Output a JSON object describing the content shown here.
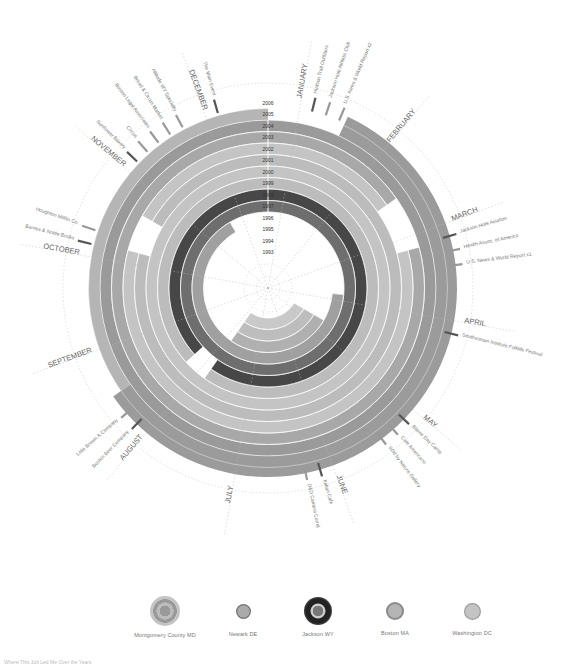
{
  "chart_data": {
    "type": "radial-timeline",
    "title": "",
    "center": [
      268,
      288
    ],
    "years": [
      "1993",
      "1994",
      "1995",
      "1996",
      "1997",
      "1998",
      "1999",
      "2000",
      "2001",
      "2002",
      "2003",
      "2004",
      "2005",
      "2006"
    ],
    "months": [
      "JANUARY",
      "FEBRUARY",
      "MARCH",
      "APRIL",
      "MAY",
      "JUNE",
      "JULY",
      "AUGUST",
      "SEPTEMBER",
      "OCTOBER",
      "NOVEMBER",
      "DECEMBER"
    ],
    "series": [
      {
        "name": "Montgomery County MD",
        "color": "#a9a9a9",
        "spans": [
          {
            "from_year": "1993",
            "to_year": "1996"
          }
        ]
      },
      {
        "name": "Newark DE",
        "color": "#8c8c8c",
        "spans": [
          {
            "from_year": "1996",
            "to_year": "1998"
          }
        ]
      },
      {
        "name": "Jackson WY",
        "color": "#3a3a3a",
        "spans": [
          {
            "from_year": "1998",
            "to_year": "1999"
          }
        ]
      },
      {
        "name": "Boston MA",
        "color": "#9a9a9a",
        "spans": [
          {
            "from_year": "1999",
            "to_year": "2004"
          }
        ]
      },
      {
        "name": "Washington DC",
        "color": "#b8b8b8",
        "spans": [
          {
            "from_year": "2004",
            "to_year": "2006"
          }
        ]
      }
    ],
    "events": [
      {
        "month": "JANUARY",
        "labels": [
          "Hudson Trail Outfitters",
          "Jackson Hole Athletic Club",
          "U.S. News & World Report x2"
        ]
      },
      {
        "month": "MARCH",
        "labels": [
          "Jackson Hole Aviation",
          "Health Assoc. of America",
          "U.S. News & World Report x1"
        ]
      },
      {
        "month": "APRIL",
        "labels": [
          "Smithsonian Institute Folklife Festival"
        ]
      },
      {
        "month": "MAY",
        "labels": [
          "Blame Day Camp",
          "Cafe Americano",
          "Wild by Nature Gallery"
        ]
      },
      {
        "month": "JUNE",
        "labels": [
          "Italian Cafe",
          "D&D Camera Corral"
        ]
      },
      {
        "month": "AUGUST",
        "labels": [
          "Boston Beer Company",
          "Little Brown & Company"
        ]
      },
      {
        "month": "OCTOBER",
        "labels": [
          "Barnes & Noble Books",
          "Houghton Mifflin Co."
        ]
      },
      {
        "month": "NOVEMBER",
        "labels": [
          "Sunflower Bakery",
          "Circus",
          "Boston Legal Associates",
          "Bread & Circus Market",
          "Altitude WY Specialty"
        ]
      },
      {
        "month": "DECEMBER",
        "labels": [
          "The Main Event"
        ]
      }
    ],
    "legend_position": "bottom"
  },
  "legend": {
    "items": [
      {
        "label": "Montgomery County MD"
      },
      {
        "label": "Newark DE"
      },
      {
        "label": "Jackson WY"
      },
      {
        "label": "Boston MA"
      },
      {
        "label": "Washington DC"
      }
    ]
  },
  "footnote": "Where This Job Led Me Over the Years"
}
